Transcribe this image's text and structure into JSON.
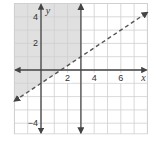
{
  "chart_data": {
    "type": "line",
    "title": "",
    "xlabel": "x",
    "ylabel": "y",
    "xlim": [
      -2,
      8
    ],
    "ylim": [
      -4.8,
      5
    ],
    "grid": true,
    "x_tick_labels": [
      "2",
      "4",
      "6"
    ],
    "y_tick_labels": [
      "4",
      "2",
      "-4"
    ],
    "series": [
      {
        "name": "boundary-vertical",
        "equation": "x = 3",
        "style": "solid",
        "x": [
          3,
          3
        ],
        "y": [
          -4.8,
          5
        ]
      },
      {
        "name": "boundary-dashed",
        "equation": "y = (2/3)x - 1",
        "style": "dashed",
        "x": [
          -2,
          8
        ],
        "y": [
          -2.33,
          4.33
        ]
      }
    ],
    "shaded_region": "x < 3 and y > (2/3)x - 1",
    "colors": {
      "shade": "#e0e0e0",
      "grid": "#cfcfcf",
      "axis": "#444444",
      "line": "#555555"
    }
  }
}
